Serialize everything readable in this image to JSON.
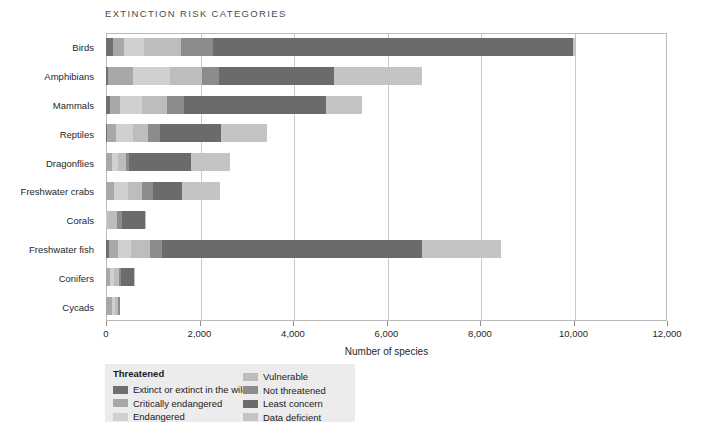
{
  "title": "EXTINCTION RISK CATEGORIES",
  "axis": {
    "x_title": "Number of species",
    "x_ticks": [
      "0",
      "2,000",
      "4,000",
      "6,000",
      "8,000",
      "10,000",
      "12,000"
    ],
    "x_tick_values": [
      0,
      2000,
      4000,
      6000,
      8000,
      10000,
      12000
    ],
    "xmin": 0,
    "xmax": 12000
  },
  "legend": {
    "title": "Threatened",
    "items": [
      {
        "label": "Extinct or extinct in the wild",
        "color": "#6f6f6f",
        "column": "left"
      },
      {
        "label": "Critically endangered",
        "color": "#a8a8a8",
        "column": "left"
      },
      {
        "label": "Endangered",
        "color": "#d0d0d0",
        "column": "left"
      },
      {
        "label": "Vulnerable",
        "color": "#bdbdbd",
        "column": "right"
      },
      {
        "label": "Not threatened",
        "color": "#8c8c8c",
        "column": "right"
      },
      {
        "label": "Least concern",
        "color": "#6b6b6b",
        "column": "right"
      },
      {
        "label": "Data deficient",
        "color": "#c4c4c4",
        "column": "right"
      }
    ]
  },
  "chart_data": {
    "type": "bar",
    "orientation": "horizontal",
    "stacked": true,
    "title": "EXTINCTION RISK CATEGORIES",
    "xlabel": "Number of species",
    "ylabel": "",
    "xlim": [
      0,
      12000
    ],
    "grid": true,
    "legend_position": "bottom-left",
    "categories": [
      "Birds",
      "Amphibians",
      "Mammals",
      "Reptiles",
      "Dragonflies",
      "Freshwater crabs",
      "Corals",
      "Freshwater fish",
      "Conifers",
      "Cycads"
    ],
    "series": [
      {
        "name": "Extinct or extinct in the wild",
        "color": "#6f6f6f",
        "values": [
          160,
          40,
          90,
          30,
          2,
          2,
          0,
          70,
          2,
          0
        ]
      },
      {
        "name": "Critically endangered",
        "color": "#a8a8a8",
        "values": [
          220,
          530,
          210,
          180,
          120,
          180,
          0,
          180,
          80,
          130
        ]
      },
      {
        "name": "Endangered",
        "color": "#d0d0d0",
        "values": [
          430,
          800,
          470,
          360,
          130,
          290,
          30,
          280,
          100,
          70
        ]
      },
      {
        "name": "Vulnerable",
        "color": "#bdbdbd",
        "values": [
          800,
          680,
          530,
          330,
          170,
          290,
          200,
          420,
          90,
          60
        ]
      },
      {
        "name": "Not threatened",
        "color": "#8c8c8c",
        "values": [
          680,
          370,
          360,
          250,
          80,
          240,
          110,
          250,
          40,
          30
        ]
      },
      {
        "name": "Least concern",
        "color": "#6b6b6b",
        "values": [
          7700,
          2450,
          3050,
          1300,
          1320,
          620,
          490,
          5550,
          280,
          0
        ]
      },
      {
        "name": "Data deficient",
        "color": "#c4c4c4",
        "values": [
          60,
          1880,
          770,
          1000,
          830,
          820,
          30,
          1700,
          30,
          0
        ]
      }
    ],
    "totals": [
      10050,
      6750,
      5480,
      3450,
      2652,
      2442,
      860,
      8450,
      622,
      290
    ]
  }
}
